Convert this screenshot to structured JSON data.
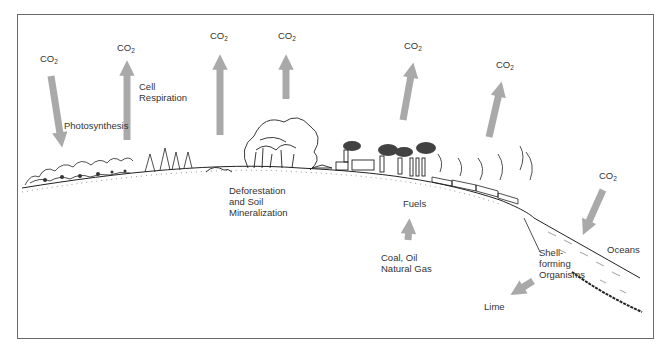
{
  "figure": {
    "co2_label": "CO",
    "co2_subscript": "2",
    "arrow_color": "#a9a9a9",
    "labels": {
      "photosynthesis": "Photosynthesis",
      "cell_respiration_1": "Cell",
      "cell_respiration_2": "Respiration",
      "deforestation_1": "Deforestation",
      "deforestation_2": "and Soil",
      "deforestation_3": "Mineralization",
      "fuels": "Fuels",
      "fossil_1": "Coal, Oil",
      "fossil_2": "Natural Gas",
      "shell_1": "Shell-",
      "shell_2": "forming",
      "shell_3": "Organisms",
      "oceans": "Oceans",
      "lime": "Lime"
    },
    "flows": [
      {
        "id": "photosynthesis",
        "direction": "down",
        "label": "CO2"
      },
      {
        "id": "cell-respiration",
        "direction": "up",
        "label": "CO2"
      },
      {
        "id": "deforestation-1",
        "direction": "up",
        "label": "CO2"
      },
      {
        "id": "deforestation-2",
        "direction": "up",
        "label": "CO2"
      },
      {
        "id": "industry",
        "direction": "up",
        "label": "CO2"
      },
      {
        "id": "vehicles",
        "direction": "up",
        "label": "CO2"
      },
      {
        "id": "ocean-uptake",
        "direction": "down",
        "label": "CO2"
      },
      {
        "id": "fossil-to-fuels",
        "direction": "up"
      },
      {
        "id": "shell-to-lime",
        "direction": "down-left"
      }
    ]
  }
}
